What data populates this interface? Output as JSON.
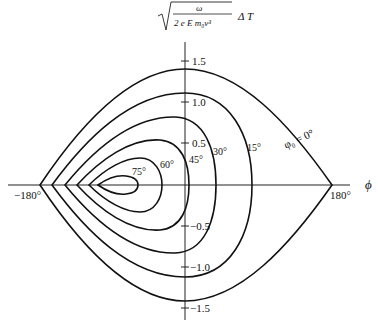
{
  "figure": {
    "ylabel": {
      "numerator": "ω",
      "denominator": "2 e E m₀v³",
      "suffix": "Δ T"
    },
    "xlabel": "ϕ",
    "curve_label_prefix": "φ₀ = 0°",
    "y_ticks": [
      {
        "label": "1.5",
        "y": 61
      },
      {
        "label": "1.0",
        "y": 102
      },
      {
        "label": "0.5",
        "y": 143
      },
      {
        "label": "−0.5",
        "y": 226
      },
      {
        "label": "−1.0",
        "y": 267
      },
      {
        "label": "−1.5",
        "y": 308
      }
    ],
    "x_ticks": [
      {
        "label": "−180°",
        "x": 40
      },
      {
        "label": "180°",
        "x": 332
      }
    ],
    "curves": [
      {
        "label": "φ₀ = 0°",
        "lx": 288,
        "ly": 147
      },
      {
        "label": "15°",
        "lx": 249,
        "ly": 149
      },
      {
        "label": "30°",
        "lx": 213,
        "ly": 162
      },
      {
        "label": "45°",
        "lx": 189,
        "ly": 163
      },
      {
        "label": "60°",
        "lx": 160,
        "ly": 168
      },
      {
        "label": "75°",
        "lx": 132,
        "ly": 176
      }
    ]
  }
}
